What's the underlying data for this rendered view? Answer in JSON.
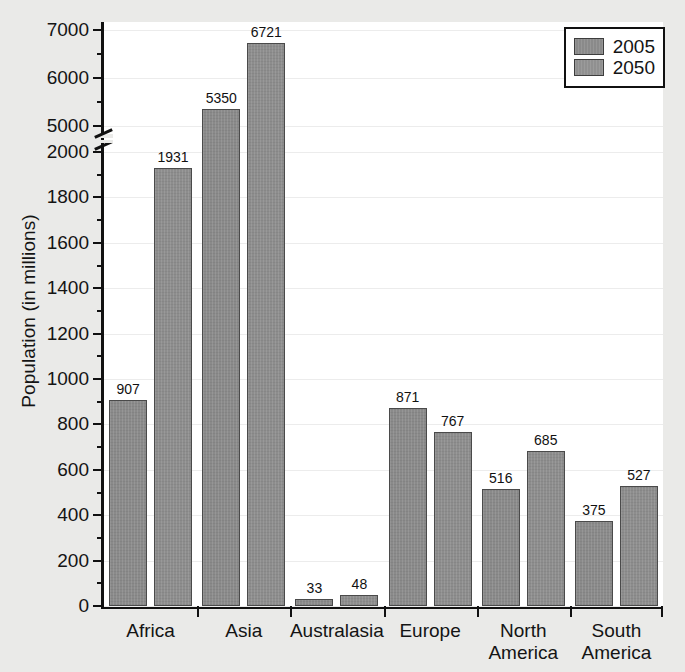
{
  "chart_data": {
    "type": "bar",
    "title": "",
    "xlabel": "",
    "ylabel": "Population (in millions)",
    "categories": [
      "Africa",
      "Asia",
      "Australasia",
      "Europe",
      "North America",
      "South America"
    ],
    "series": [
      {
        "name": "2005",
        "values": [
          907,
          5350,
          33,
          871,
          516,
          375
        ]
      },
      {
        "name": "2050",
        "values": [
          1931,
          6721,
          48,
          767,
          685,
          527
        ]
      }
    ],
    "legend": [
      "2005",
      "2050"
    ],
    "legend_position": "top-right",
    "grid": true,
    "axis_break": {
      "below": 2000,
      "above": 5000
    },
    "ylim_lower": [
      0,
      2000
    ],
    "ylim_upper": [
      5000,
      7000
    ],
    "ytick_labels_lower": [
      "0",
      "200",
      "400",
      "600",
      "800",
      "1000",
      "1200",
      "1400",
      "1600",
      "1800",
      "2000"
    ],
    "ytick_labels_upper": [
      "5000",
      "6000",
      "7000"
    ],
    "ytick_values_lower": [
      0,
      200,
      400,
      600,
      800,
      1000,
      1200,
      1400,
      1600,
      1800,
      2000
    ],
    "ytick_values_upper": [
      5000,
      6000,
      7000
    ],
    "yminor_step_lower": 100,
    "yminor_step_upper": 500,
    "value_labels": [
      "907",
      "1931",
      "5350",
      "6721",
      "33",
      "48",
      "871",
      "767",
      "516",
      "685",
      "375",
      "527"
    ]
  },
  "colors": {
    "bar_2005": "#8a8a8a",
    "bar_2050": "#8d8d8d",
    "bar_edge": "#4a4a4a",
    "axis": "#111111",
    "grid": "#ececec",
    "plot_background": "#ffffff",
    "page_background": "#eaeae8",
    "text": "#141414"
  }
}
